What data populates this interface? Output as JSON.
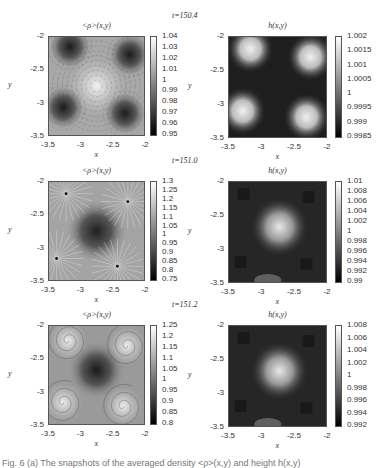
{
  "figure": {
    "rows": [
      {
        "time_label": "t=150.4",
        "left": {
          "title": "<ρ>(x,y)",
          "colorbar_ticks": [
            "1.04",
            "1.03",
            "1.02",
            "1.01",
            "1",
            "0.99",
            "0.98",
            "0.97",
            "0.96",
            "0.95"
          ],
          "pattern": "vortex"
        },
        "right": {
          "title": "h(x,y)",
          "colorbar_ticks": [
            "1.002",
            "1.0015",
            "1.001",
            "1.0005",
            "1",
            "0.9995",
            "0.999",
            "0.9985"
          ],
          "pattern": "corners"
        }
      },
      {
        "time_label": "t=151.0",
        "left": {
          "title": "<ρ>(x,y)",
          "colorbar_ticks": [
            "1.3",
            "1.25",
            "1.2",
            "1.15",
            "1.1",
            "1.05",
            "1",
            "0.95",
            "0.9",
            "0.85",
            "0.8",
            "0.75"
          ],
          "pattern": "radial"
        },
        "right": {
          "title": "h(x,y)",
          "colorbar_ticks": [
            "1.01",
            "1.008",
            "1.006",
            "1.004",
            "1.002",
            "1",
            "0.998",
            "0.996",
            "0.994",
            "0.992",
            "0.99"
          ],
          "pattern": "center"
        }
      },
      {
        "time_label": "t=151.2",
        "left": {
          "title": "<ρ>(x,y)",
          "colorbar_ticks": [
            "1.25",
            "1.2",
            "1.15",
            "1.1",
            "1.05",
            "1",
            "0.95",
            "0.9",
            "0.85",
            "0.8"
          ],
          "pattern": "spiral"
        },
        "right": {
          "title": "h(x,y)",
          "colorbar_ticks": [
            "1.008",
            "1.006",
            "1.004",
            "1.002",
            "1",
            "0.998",
            "0.996",
            "0.994",
            "0.992"
          ],
          "pattern": "center"
        }
      }
    ],
    "x_ticks": [
      "-3.5",
      "-3",
      "-2.5",
      "-2"
    ],
    "y_ticks": [
      "-2",
      "-2.5",
      "-3",
      "-3.5"
    ],
    "x_label": "x",
    "y_label": "y",
    "caption": "Fig. 6 (a) The snapshots of the averaged density <ρ>(x,y) and height h(x,y)"
  },
  "chart_data": [
    {
      "type": "heatmap",
      "title": "<ρ>(x,y)",
      "time": 150.4,
      "xlabel": "x",
      "ylabel": "y",
      "xlim": [
        -3.5,
        -2
      ],
      "ylim": [
        -3.5,
        -2
      ],
      "colorbar_range": [
        0.95,
        1.04
      ],
      "features": "dark minima (~0.95) near (-3.2,-2.15), (-2.2,-2.25), (-3.3,-3.1), (-2.3,-3.25); bright maximum (~1.04) near center (-2.75,-2.75); swirling flow lines"
    },
    {
      "type": "heatmap",
      "title": "h(x,y)",
      "time": 150.4,
      "xlabel": "x",
      "ylabel": "y",
      "xlim": [
        -3.5,
        -2
      ],
      "ylim": [
        -3.5,
        -2
      ],
      "colorbar_range": [
        0.9985,
        1.002
      ],
      "features": "bright maxima (~1.002) near four corners (-3.2,-2.15), (-2.2,-2.3), (-3.35,-3.1), (-2.3,-3.25); dark elsewhere"
    },
    {
      "type": "heatmap",
      "title": "<ρ>(x,y)",
      "time": 151.0,
      "xlabel": "x",
      "ylabel": "y",
      "xlim": [
        -3.5,
        -2
      ],
      "ylim": [
        -3.5,
        -2
      ],
      "colorbar_range": [
        0.75,
        1.3
      ],
      "features": "dark minimum (~0.8) at center (-2.7,-2.7); radial flow lines from point sources near (-3.25,-2.2), (-2.25,-2.3), (-3.4,-3.2), (-2.4,-3.3)"
    },
    {
      "type": "heatmap",
      "title": "h(x,y)",
      "time": 151.0,
      "xlabel": "x",
      "ylabel": "y",
      "xlim": [
        -3.5,
        -2
      ],
      "ylim": [
        -3.5,
        -2
      ],
      "colorbar_range": [
        0.99,
        1.01
      ],
      "features": "bright maximum (~1.01) at center (-2.75,-2.7); dark patches around corners"
    },
    {
      "type": "heatmap",
      "title": "<ρ>(x,y)",
      "time": 151.2,
      "xlabel": "x",
      "ylabel": "y",
      "xlim": [
        -3.5,
        -2
      ],
      "ylim": [
        -3.5,
        -2
      ],
      "colorbar_range": [
        0.8,
        1.25
      ],
      "features": "dark minimum (~0.8) at center (-2.75,-2.7); bright spiral vortices in four corners"
    },
    {
      "type": "heatmap",
      "title": "h(x,y)",
      "time": 151.2,
      "xlabel": "x",
      "ylabel": "y",
      "xlim": [
        -3.5,
        -2
      ],
      "ylim": [
        -3.5,
        -2
      ],
      "colorbar_range": [
        0.992,
        1.008
      ],
      "features": "bright maximum (~1.008) at center (-2.75,-2.7); darker patches near corners"
    }
  ]
}
